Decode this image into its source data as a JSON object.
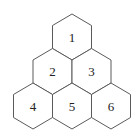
{
  "diagram": {
    "type": "hexagon-pyramid",
    "rows": 3,
    "cells": [
      {
        "label": "1",
        "row": 0,
        "cx": 72,
        "cy": 37
      },
      {
        "label": "2",
        "row": 1,
        "cx": 52.5,
        "cy": 71
      },
      {
        "label": "3",
        "row": 1,
        "cx": 91.5,
        "cy": 71
      },
      {
        "label": "4",
        "row": 2,
        "cx": 33,
        "cy": 106
      },
      {
        "label": "5",
        "row": 2,
        "cx": 72,
        "cy": 106
      },
      {
        "label": "6",
        "row": 2,
        "cx": 111,
        "cy": 106
      }
    ],
    "stroke_color": "#5a5a5a",
    "fill_color": "#ffffff"
  }
}
